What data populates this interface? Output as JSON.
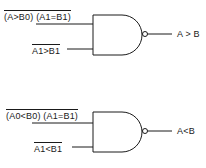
{
  "gates": [
    {
      "type": "NAND",
      "inputs": [
        {
          "label": "(A>B0) (A1=B1)",
          "inverted": true
        },
        {
          "label": "A1>B1",
          "inverted": true
        }
      ],
      "output": {
        "label": "A > B"
      }
    },
    {
      "type": "NAND",
      "inputs": [
        {
          "label": "(A0<B0) (A1=B1)",
          "inverted": true
        },
        {
          "label": "A1<B1",
          "inverted": true
        }
      ],
      "output": {
        "label": "A<B"
      }
    }
  ],
  "colors": {
    "line": "#1a1a1a",
    "background": "#ffffff"
  }
}
